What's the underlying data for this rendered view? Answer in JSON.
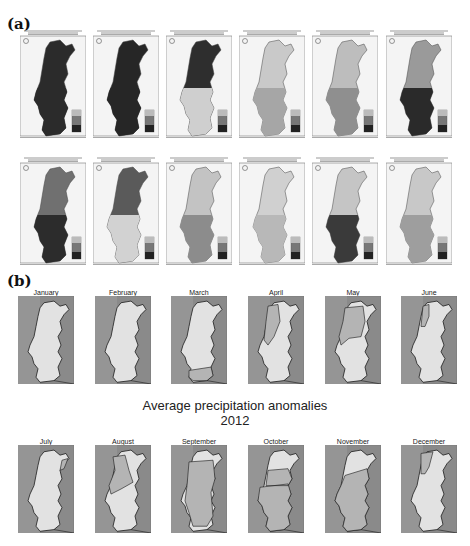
{
  "figure": {
    "part_a": {
      "label": "(a)",
      "description": "Monthly precipitation percentage maps of Portugal, 2012 (grayscale choropleths, 12 panels)",
      "months": [
        "January",
        "February",
        "March",
        "April",
        "May",
        "June",
        "July",
        "August",
        "September",
        "October",
        "November",
        "December"
      ]
    },
    "part_b": {
      "label": "(b)",
      "title_line1": "Average precipitation anomalies",
      "title_line2": "2012",
      "panels": [
        {
          "month": "January"
        },
        {
          "month": "February"
        },
        {
          "month": "March"
        },
        {
          "month": "April"
        },
        {
          "month": "May"
        },
        {
          "month": "June"
        },
        {
          "month": "July"
        },
        {
          "month": "August"
        },
        {
          "month": "September"
        },
        {
          "month": "October"
        },
        {
          "month": "November"
        },
        {
          "month": "December"
        }
      ]
    },
    "colors": {
      "sea": "#8a8a8a",
      "land_light": "#e2e2e2",
      "land_mid": "#b4b4b4",
      "map_dark": "#2a2a2a",
      "background": "#ffffff"
    }
  }
}
